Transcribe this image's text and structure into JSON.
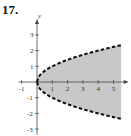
{
  "problem_number": "17.",
  "chart_data": {
    "type": "area",
    "title": "",
    "xlabel": "",
    "ylabel": "y",
    "xlim": [
      -1.2,
      5.6
    ],
    "ylim": [
      -3.3,
      4
    ],
    "x_ticks": [
      -1,
      1,
      2,
      3,
      4,
      5
    ],
    "y_ticks": [
      -3,
      -2,
      -1,
      1,
      2,
      3
    ],
    "grid": false,
    "legend": null,
    "series": [
      {
        "name": "upper boundary y = sqrt(x)",
        "style": "dashed",
        "x": [
          0,
          1,
          2,
          3,
          4,
          5,
          5.5
        ],
        "values": [
          0,
          1,
          1.41,
          1.73,
          2,
          2.24,
          2.35
        ]
      },
      {
        "name": "lower boundary y = -sqrt(x)",
        "style": "dashed",
        "x": [
          0,
          1,
          2,
          3,
          4,
          5,
          5.5
        ],
        "values": [
          0,
          -1,
          -1.41,
          -1.73,
          -2,
          -2.24,
          -2.35
        ]
      }
    ],
    "shaded_region": "y^2 < x (between dashed curves), shaded gray"
  }
}
